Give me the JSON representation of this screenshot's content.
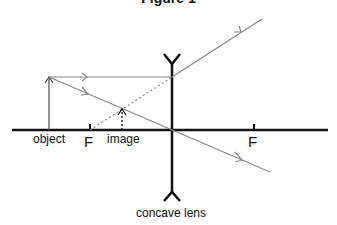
{
  "title": "Figure 1",
  "labels": {
    "object": "object",
    "focal_left": "F",
    "image": "image",
    "focal_right": "F",
    "lens": "concave lens"
  },
  "colors": {
    "axis": "#111111",
    "ray": "#888888",
    "dotted": "#888888"
  }
}
